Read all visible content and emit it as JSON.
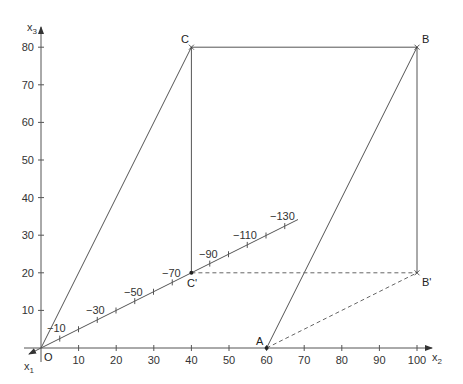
{
  "diagram": {
    "axes": {
      "x1": {
        "label": "x",
        "sub": "1"
      },
      "x2": {
        "label": "x",
        "sub": "2",
        "ticks": [
          "10",
          "20",
          "30",
          "40",
          "50",
          "60",
          "70",
          "80",
          "90",
          "100"
        ]
      },
      "x3": {
        "label": "x",
        "sub": "3",
        "ticks": [
          "10",
          "20",
          "30",
          "40",
          "50",
          "60",
          "70",
          "80"
        ]
      },
      "x1_ticks": [
        "−10",
        "−30",
        "−50",
        "−70",
        "−90",
        "−110",
        "−130"
      ]
    },
    "origin_label": "O",
    "points": {
      "A": "A",
      "B": "B",
      "C": "C",
      "B_prime": "B'",
      "C_prime": "C'"
    },
    "coordinates": {
      "O": [
        0,
        0,
        0
      ],
      "A": [
        0,
        60,
        0
      ],
      "B": [
        0,
        100,
        80
      ],
      "C": [
        0,
        40,
        80
      ],
      "B_prime": [
        0,
        100,
        20
      ],
      "C_prime": [
        -80,
        40,
        20
      ]
    },
    "colors": {
      "line": "#555555",
      "text": "#333333",
      "background": "#ffffff"
    }
  }
}
